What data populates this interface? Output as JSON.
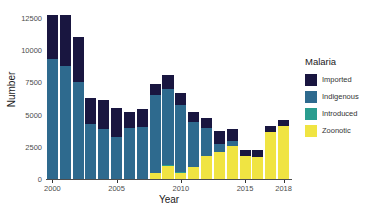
{
  "chart_data": {
    "type": "bar",
    "stacked": true,
    "title": "",
    "xlabel": "Year",
    "ylabel": "Number",
    "legend_title": "Malaria",
    "legend_position": "right",
    "grid": false,
    "ylim": [
      0,
      13200
    ],
    "y_ticks": [
      0,
      2500,
      5000,
      7500,
      10000,
      12500
    ],
    "y_tick_labels": [
      "0",
      "2500",
      "5000",
      "7500",
      "10000",
      "12500"
    ],
    "x_ticks": [
      2000,
      2005,
      2010,
      2015,
      2018
    ],
    "x_tick_labels": [
      "2000",
      "2005",
      "2010",
      "2015",
      "2018"
    ],
    "categories": [
      2000,
      2001,
      2002,
      2003,
      2004,
      2005,
      2006,
      2007,
      2008,
      2009,
      2010,
      2011,
      2012,
      2013,
      2014,
      2015,
      2016,
      2017,
      2018
    ],
    "series": [
      {
        "name": "Zoonotic",
        "color": "#f0e442",
        "values": [
          0,
          0,
          0,
          0,
          0,
          0,
          0,
          0,
          450,
          1000,
          500,
          900,
          1800,
          2100,
          2550,
          1750,
          1700,
          3650,
          4100
        ]
      },
      {
        "name": "Introduced",
        "color": "#2a9d8f",
        "values": [
          0,
          0,
          0,
          0,
          0,
          0,
          0,
          0,
          0,
          60,
          60,
          60,
          0,
          0,
          0,
          0,
          0,
          0,
          0
        ]
      },
      {
        "name": "Indigenous",
        "color": "#2e6a8e",
        "values": [
          9300,
          8800,
          7550,
          4250,
          3900,
          3300,
          4000,
          4050,
          6050,
          5900,
          5200,
          3500,
          2150,
          600,
          400,
          0,
          0,
          0,
          0
        ]
      },
      {
        "name": "Imported",
        "color": "#191640",
        "values": [
          3400,
          3950,
          3500,
          2050,
          2200,
          2250,
          1200,
          1400,
          900,
          1150,
          950,
          750,
          750,
          1000,
          950,
          500,
          550,
          450,
          450
        ]
      }
    ],
    "totals": [
      12700,
      12750,
      11050,
      6300,
      6100,
      5550,
      5200,
      5450,
      7400,
      8110,
      6710,
      5210,
      4700,
      3700,
      3900,
      2250,
      2250,
      4100,
      4550
    ]
  },
  "legend": {
    "title": "Malaria",
    "entries": [
      {
        "label": "Imported",
        "color": "#191640"
      },
      {
        "label": "Indigenous",
        "color": "#2e6a8e"
      },
      {
        "label": "Introduced",
        "color": "#2a9d8f"
      },
      {
        "label": "Zoonotic",
        "color": "#f0e442"
      }
    ]
  },
  "axes": {
    "x_title": "Year",
    "y_title": "Number"
  }
}
